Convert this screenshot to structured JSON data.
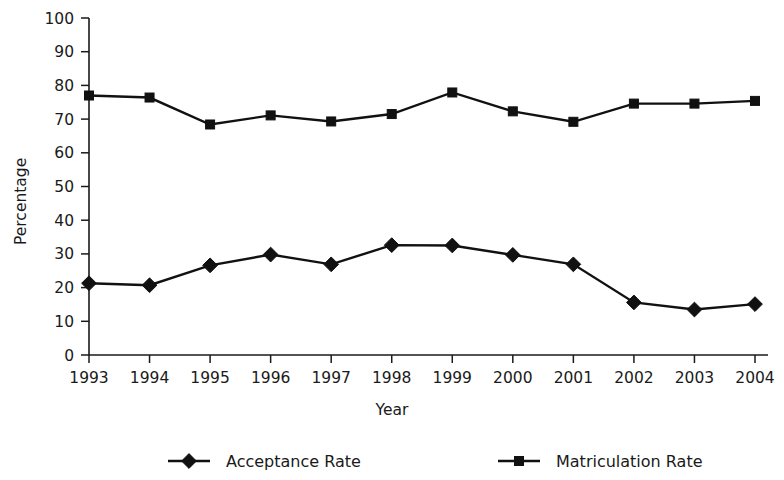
{
  "chart_data": {
    "type": "line",
    "title": "",
    "xlabel": "Year",
    "ylabel": "Percentage",
    "categories": [
      "1993",
      "1994",
      "1995",
      "1996",
      "1997",
      "1998",
      "1999",
      "2000",
      "2001",
      "2002",
      "2003",
      "2004"
    ],
    "series": [
      {
        "name": "Acceptance Rate",
        "marker": "diamond",
        "color": "#111111",
        "values": [
          21.3,
          20.7,
          26.6,
          29.8,
          26.9,
          32.6,
          32.5,
          29.7,
          26.9,
          15.6,
          13.5,
          15.1
        ]
      },
      {
        "name": "Matriculation Rate",
        "marker": "square",
        "color": "#111111",
        "values": [
          77.0,
          76.4,
          68.4,
          71.1,
          69.3,
          71.5,
          77.9,
          72.3,
          69.2,
          74.6,
          74.6,
          75.4
        ]
      }
    ],
    "ylim": [
      0,
      100
    ],
    "ytick_step": 10,
    "yticks": [
      "0",
      "10",
      "20",
      "30",
      "40",
      "50",
      "60",
      "70",
      "80",
      "90",
      "100"
    ],
    "grid": false,
    "legend_position": "bottom"
  },
  "legend": {
    "entries": [
      {
        "label": "Acceptance Rate",
        "marker": "diamond"
      },
      {
        "label": "Matriculation Rate",
        "marker": "square"
      }
    ]
  },
  "axes": {
    "y_title": "Percentage",
    "x_title": "Year"
  }
}
